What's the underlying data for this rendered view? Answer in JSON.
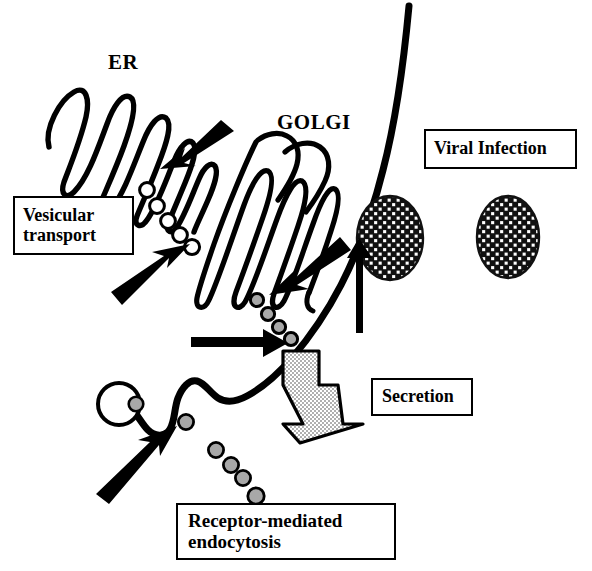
{
  "figure": {
    "background_color": "#ffffff",
    "ink_color": "#000000",
    "vesicle_fill": "#a8a8a8",
    "secretion_arrow_fill": "#d2d2d2"
  },
  "labels": {
    "er": "ER",
    "golgi": "GOLGI"
  },
  "boxes": {
    "vesicular_transport": {
      "line1": "Vesicular",
      "line2": "transport"
    },
    "viral_infection": {
      "text": "Viral Infection"
    },
    "secretion": {
      "text": "Secretion"
    },
    "receptor_mediated_endocytosis": {
      "line1": "Receptor-mediated",
      "line2": "endocytosis"
    }
  },
  "structures": {
    "er_label": "endoplasmic-reticulum-coil",
    "golgi_label": "golgi-stack-ribbon",
    "plasma_membrane_label": "plasma-membrane-curve",
    "viral_particle_count": 2,
    "transport_vesicle_chain_count": 5,
    "golgi_exit_vesicle_count": 4,
    "endocytic_receptor_dot_count": 5,
    "free_vesicle_count": 1
  },
  "arrows": {
    "er_inbound": "arrow-to-er",
    "vesicular_transport_up": "arrow-vesicular-transport",
    "golgi_inbound": "arrow-to-golgi",
    "golgi_exit": "arrow-golgi-exit",
    "viral_entry": "arrow-viral-entry",
    "endocytosis_inbound": "arrow-endocytosis",
    "secretion_block": "block-arrow-secretion"
  }
}
